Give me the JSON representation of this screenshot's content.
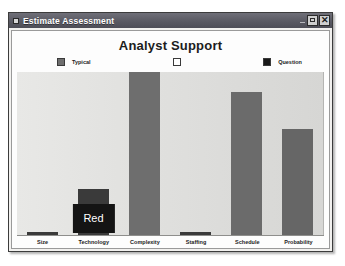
{
  "window": {
    "title": "Estimate Assessment",
    "icon": "app-icon",
    "buttons": {
      "minimize": "–",
      "maximize": "□",
      "close": "✕"
    }
  },
  "chart_data": {
    "type": "bar",
    "title": "Analyst Support",
    "xlabel": "",
    "ylabel": "",
    "ylim": [
      0,
      100
    ],
    "grid": false,
    "legend_position": "top",
    "categories": [
      "Size",
      "Technology",
      "Complexity",
      "Staffing",
      "Schedule",
      "Probability"
    ],
    "values": [
      2,
      28,
      100,
      2,
      88,
      65
    ],
    "bar_colors": [
      "#3a3a3a",
      "#3a3a3a",
      "#6e6e6e",
      "#3a3a3a",
      "#6b6b6b",
      "#666666"
    ],
    "legend": [
      {
        "label": "Typical",
        "color": "#6e6e6e"
      },
      {
        "label": "",
        "color": "#ffffff"
      },
      {
        "label": "Question",
        "color": "#1a1a1a"
      }
    ],
    "annotations": [
      {
        "category": "Technology",
        "text": "Red",
        "background": "#141414",
        "color": "#ffffff"
      }
    ]
  }
}
